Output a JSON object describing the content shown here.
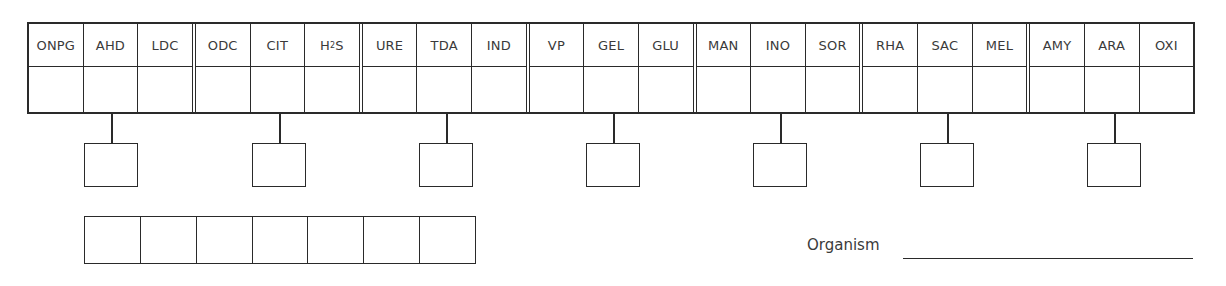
{
  "form": {
    "tests": [
      {
        "label": "ONPG",
        "group": 1
      },
      {
        "label": "AHD",
        "group": 1
      },
      {
        "label": "LDC",
        "group": 1
      },
      {
        "label": "ODC",
        "group": 2
      },
      {
        "label": "CIT",
        "group": 2
      },
      {
        "label": "H2S",
        "display_base": "H",
        "display_sub": "2",
        "display_tail": "S",
        "group": 2
      },
      {
        "label": "URE",
        "group": 3
      },
      {
        "label": "TDA",
        "group": 3
      },
      {
        "label": "IND",
        "group": 3
      },
      {
        "label": "VP",
        "group": 4
      },
      {
        "label": "GEL",
        "group": 4
      },
      {
        "label": "GLU",
        "group": 4
      },
      {
        "label": "MAN",
        "group": 5
      },
      {
        "label": "INO",
        "group": 5
      },
      {
        "label": "SOR",
        "group": 5
      },
      {
        "label": "RHA",
        "group": 6
      },
      {
        "label": "SAC",
        "group": 6
      },
      {
        "label": "MEL",
        "group": 6
      },
      {
        "label": "AMY",
        "group": 7
      },
      {
        "label": "ARA",
        "group": 7
      },
      {
        "label": "OXI",
        "group": 7
      }
    ],
    "results": [
      "",
      "",
      "",
      "",
      "",
      "",
      "",
      "",
      "",
      "",
      "",
      "",
      "",
      "",
      "",
      "",
      "",
      "",
      "",
      "",
      ""
    ],
    "group_scores": [
      "",
      "",
      "",
      "",
      "",
      "",
      ""
    ],
    "profile_code": [
      "",
      "",
      "",
      "",
      "",
      "",
      ""
    ],
    "organism": {
      "label": "Organism",
      "value": ""
    }
  },
  "colors": {
    "line": "#2a2a2a",
    "text": "#3a3a3a",
    "background": "#ffffff"
  }
}
